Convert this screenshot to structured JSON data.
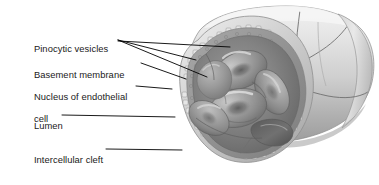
{
  "figure": {
    "background_color": "#ffffff",
    "text_color": "#1a1a1a",
    "leader_line_color": "#000000",
    "width": 379,
    "height": 185
  },
  "labels": [
    {
      "id": "pinocytic-vesicles",
      "text": "Pinocytic vesicles",
      "x": 18,
      "y": 36
    },
    {
      "id": "basement-membrane",
      "text": "Basement membrane",
      "x": 18,
      "y": 62
    },
    {
      "id": "nucleus-of-endothelial-cell",
      "text": "Nucleus of endothelial",
      "text_line2": "cell",
      "x": 18,
      "y": 83
    },
    {
      "id": "lumen",
      "text": "Lumen",
      "x": 18,
      "y": 111
    },
    {
      "id": "intercellular-cleft",
      "text": "Intercellular cleft",
      "x": 18,
      "y": 145
    }
  ],
  "illustration": {
    "name": "capillary-cutaway-illustration",
    "description": "Grayscale airbrush anatomical illustration of a capillary tube cut open at the left end, revealing the lumen with stacked biconcave red blood cells, a scalloped basement membrane rim, endothelial cell nucleus bulge, and an intercellular cleft gap in the wall.",
    "style": "grayscale medical airbrush rendering",
    "structures": [
      "vessel-wall-exterior",
      "basement-membrane-rim",
      "endothelial-lining",
      "lumen-cavity",
      "red-blood-cells",
      "endothelial-nucleus",
      "intercellular-cleft",
      "pinocytic-vesicle-dots"
    ],
    "palette": {
      "wall_light": "#e3e3e3",
      "wall_mid": "#c4c4c4",
      "wall_shadow": "#9a9a9a",
      "rim_light": "#d8d8d8",
      "lumen_dark": "#6f6f6f",
      "lumen_mid": "#878787",
      "rbc_light": "#b4b4b4",
      "rbc_mid": "#8e8e8e",
      "rbc_dark": "#656565",
      "cleft_dark": "#4d4d4d",
      "outline": "#555555"
    },
    "red_blood_cell_count": 4
  }
}
